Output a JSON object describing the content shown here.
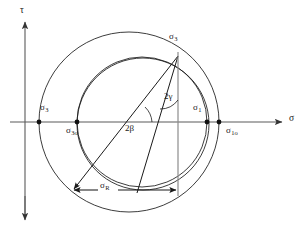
{
  "figure": {
    "background_color": "#ffffff",
    "line_color": "#1a1a1a",
    "axis_color": "#555555"
  },
  "axes": {
    "vertical": {
      "name": "tau-axis",
      "label": "τ",
      "label_x": 20,
      "label_y": 7,
      "arrow": "up"
    },
    "horizontal": {
      "name": "sigma-axis",
      "label": "σ",
      "label_x": 289,
      "label_y": 116,
      "arrow": "right"
    }
  },
  "labels": [
    {
      "id": "sigma3-left",
      "base": "σ",
      "sub": "3",
      "x": 40,
      "y": 105,
      "align": "left"
    },
    {
      "id": "sigma3o",
      "base": "σ",
      "sub": "3o",
      "x": 66,
      "y": 126,
      "align": "left"
    },
    {
      "id": "sigma1",
      "base": "σ",
      "sub": "1",
      "x": 193,
      "y": 105,
      "align": "left"
    },
    {
      "id": "sigma1o",
      "base": "σ",
      "sub": "1o",
      "x": 225,
      "y": 126,
      "align": "left"
    },
    {
      "id": "sigma3-apex",
      "base": "σ",
      "sub": "3",
      "x": 169,
      "y": 33,
      "align": "left"
    },
    {
      "id": "sigmaR",
      "base": "σ",
      "sub": "R",
      "x": 100,
      "y": 182,
      "align": "left"
    }
  ],
  "angles": [
    {
      "id": "two-gamma",
      "text": "2γ",
      "x": 164,
      "y": 93
    },
    {
      "id": "two-beta",
      "text": "2β",
      "x": 125,
      "y": 125
    }
  ],
  "points": [
    {
      "id": "pt-sigma3",
      "x": 39,
      "y": 122
    },
    {
      "id": "pt-sigma3o",
      "x": 77,
      "y": 122
    },
    {
      "id": "pt-sigma1",
      "x": 207,
      "y": 122
    },
    {
      "id": "pt-sigma1o",
      "x": 219,
      "y": 122
    },
    {
      "id": "pt-apex",
      "x": 178,
      "y": 56
    }
  ],
  "circles": [
    {
      "id": "outer-circle",
      "cx": 129,
      "cy": 122,
      "r": 90
    },
    {
      "id": "middle-circle",
      "cx": 142,
      "cy": 122,
      "r": 65
    },
    {
      "id": "inner-circle",
      "cx": 143,
      "cy": 122,
      "r": 66
    }
  ],
  "dimension": {
    "id": "sigma-R-dimension",
    "x1": 72,
    "x2": 178,
    "y": 190
  }
}
